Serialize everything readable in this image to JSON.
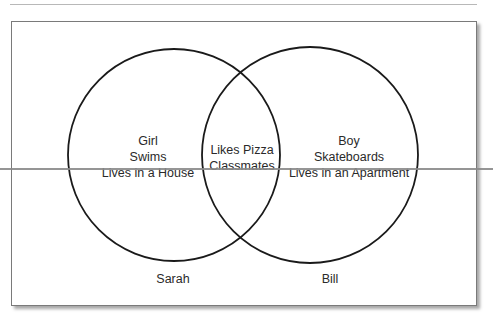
{
  "diagram": {
    "type": "venn",
    "left_set": {
      "name": "Sarah",
      "items": [
        "Girl",
        "Swims",
        "Lives in a House"
      ]
    },
    "intersection": {
      "items": [
        "Likes Pizza",
        "Classmates"
      ]
    },
    "right_set": {
      "name": "Bill",
      "items": [
        "Boy",
        "Skateboards",
        "Lives in an Apartment"
      ]
    },
    "colors": {
      "circle_stroke": "#1a1a1a",
      "frame_border": "#7a7a7a",
      "text": "#2a2a2a",
      "strike_line": "#8a8a8a"
    }
  }
}
